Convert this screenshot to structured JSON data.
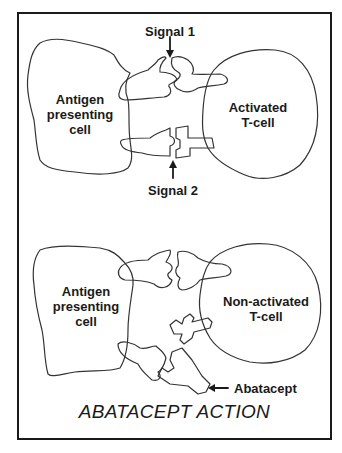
{
  "diagram": {
    "title": "ABATACEPT ACTION",
    "panels": [
      {
        "name": "activated",
        "cells": {
          "apc_label": "Antigen\npresenting\ncell",
          "tcell_label": "Activated\nT-cell"
        },
        "signals": [
          "Signal 1",
          "Signal 2"
        ]
      },
      {
        "name": "non-activated",
        "cells": {
          "apc_label": "Antigen\npresenting\ncell",
          "tcell_label": "Non-activated\nT-cell"
        },
        "drug_label": "Abatacept"
      }
    ],
    "colors": {
      "stroke": "#1a1a1a",
      "background": "#ffffff"
    }
  }
}
